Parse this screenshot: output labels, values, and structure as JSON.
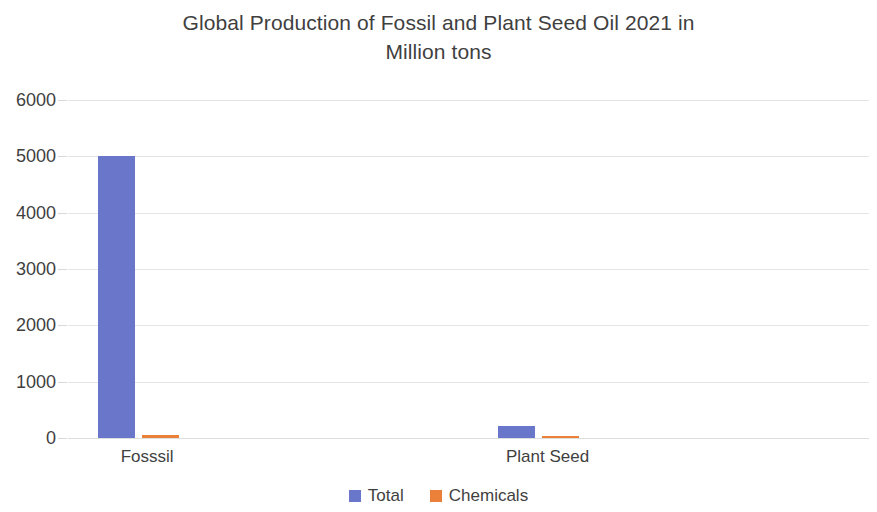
{
  "chart_data": {
    "type": "bar",
    "title": "Global Production of Fossil and Plant Seed Oil 2021 in Million tons",
    "title_line1": "Global Production of Fossil and Plant Seed Oil 2021 in",
    "title_line2": "Million tons",
    "xlabel": "",
    "ylabel": "",
    "categories": [
      "Fosssil",
      "Plant Seed"
    ],
    "series": [
      {
        "name": "Total",
        "values": [
          5000,
          220
        ],
        "color": "#6a76c9"
      },
      {
        "name": "Chemicals",
        "values": [
          50,
          20
        ],
        "color": "#eb8038"
      }
    ],
    "ylim": [
      0,
      6000
    ],
    "y_ticks": [
      0,
      1000,
      2000,
      3000,
      4000,
      5000,
      6000
    ],
    "y_tick_labels": [
      "0",
      "1000",
      "2000",
      "3000",
      "4000",
      "5000",
      "6000"
    ],
    "grid": true,
    "grid_color": "#e4e4e4",
    "legend_position": "bottom",
    "legend": [
      "Total",
      "Chemicals"
    ],
    "background": "#ffffff",
    "text_color": "#3f3f3f"
  }
}
